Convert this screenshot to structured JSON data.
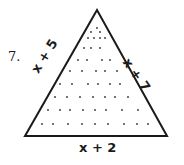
{
  "problem": {
    "number": "7.",
    "left_side": "x + 5",
    "right_side": "x + 7",
    "base": "x + 2"
  },
  "figure": {
    "shape": "triangle",
    "apex": [
      97,
      10
    ],
    "base_left": [
      25,
      136
    ],
    "base_right": [
      167,
      136
    ],
    "stroke_color": "#1a1a1a",
    "dot_color": "#333333",
    "dot_rows": [
      [
        [
          97,
          28
        ]
      ],
      [
        [
          91,
          32
        ],
        [
          100,
          32
        ]
      ],
      [
        [
          88,
          38
        ],
        [
          94,
          38
        ],
        [
          100,
          38
        ],
        [
          105,
          38
        ]
      ],
      [
        [
          84,
          48
        ],
        [
          91,
          48
        ],
        [
          100,
          48
        ]
      ],
      [
        [
          78,
          60
        ],
        [
          87,
          60
        ],
        [
          102,
          60
        ],
        [
          110,
          60
        ]
      ],
      [
        [
          70,
          71
        ],
        [
          82,
          71
        ],
        [
          96,
          71
        ],
        [
          105,
          71
        ],
        [
          117,
          71
        ]
      ],
      [
        [
          60,
          84
        ],
        [
          72,
          84
        ],
        [
          88,
          84
        ],
        [
          98,
          84
        ],
        [
          110,
          84
        ],
        [
          120,
          84
        ]
      ],
      [
        [
          55,
          97
        ],
        [
          67,
          97
        ],
        [
          80,
          97
        ],
        [
          93,
          97
        ],
        [
          105,
          97
        ],
        [
          115,
          97
        ],
        [
          128,
          97
        ]
      ],
      [
        [
          48,
          110
        ],
        [
          60,
          110
        ],
        [
          70,
          110
        ],
        [
          83,
          110
        ],
        [
          95,
          110
        ],
        [
          106,
          110
        ],
        [
          122,
          110
        ],
        [
          138,
          110
        ]
      ],
      [
        [
          42,
          124
        ],
        [
          53,
          124
        ],
        [
          68,
          124
        ],
        [
          82,
          124
        ],
        [
          95,
          124
        ],
        [
          108,
          124
        ],
        [
          124,
          124
        ],
        [
          137,
          124
        ],
        [
          148,
          124
        ]
      ]
    ]
  }
}
